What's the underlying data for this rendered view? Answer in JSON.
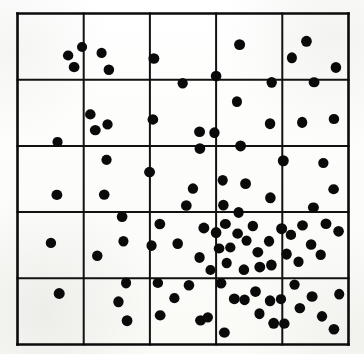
{
  "figure": {
    "title": "Clustered point pattern with 5 by 5 quadrat grid",
    "background_color": "#fdfdfb",
    "ink_color": "#0a0a0a",
    "grid_color": "#121212"
  },
  "chart_data": {
    "type": "scatter",
    "title": "Clustered point pattern with 5 by 5 quadrat grid",
    "subtitle": "",
    "xlabel": "",
    "ylabel": "",
    "xlim": [
      0,
      100
    ],
    "ylim": [
      0,
      100
    ],
    "grid": true,
    "grid_rows": 5,
    "grid_columns": 5,
    "x_gridlines": [
      0,
      20,
      40,
      60,
      80,
      100
    ],
    "y_gridlines": [
      0,
      20,
      40,
      60,
      80,
      100
    ],
    "xticklabels": [],
    "yticklabels": [],
    "legend": null,
    "legend_position": "none",
    "marker": "filled-circle",
    "marker_color": "#0a0a0a",
    "marker_radius_units": 1.6,
    "n_points": 100,
    "quadrat_counts": [
      [
        5,
        4,
        2,
        2,
        4
      ],
      [
        1,
        4,
        4,
        3,
        3
      ],
      [
        2,
        3,
        4,
        5,
        4
      ],
      [
        2,
        3,
        5,
        17,
        7
      ],
      [
        1,
        3,
        5,
        12,
        7
      ]
    ],
    "points": [
      {
        "x": 19.5,
        "y": 89.9
      },
      {
        "x": 15.3,
        "y": 87.3
      },
      {
        "x": 17.1,
        "y": 83.8
      },
      {
        "x": 25.4,
        "y": 88.1
      },
      {
        "x": 27.6,
        "y": 83.0
      },
      {
        "x": 41.2,
        "y": 86.4
      },
      {
        "x": 49.9,
        "y": 78.9
      },
      {
        "x": 60.0,
        "y": 81.1
      },
      {
        "x": 67.1,
        "y": 90.6
      },
      {
        "x": 76.8,
        "y": 79.2
      },
      {
        "x": 87.3,
        "y": 91.6
      },
      {
        "x": 82.9,
        "y": 86.6
      },
      {
        "x": 96.2,
        "y": 83.7
      },
      {
        "x": 89.6,
        "y": 79.2
      },
      {
        "x": 12.1,
        "y": 61.2
      },
      {
        "x": 22.0,
        "y": 69.5
      },
      {
        "x": 23.5,
        "y": 64.8
      },
      {
        "x": 27.2,
        "y": 66.5
      },
      {
        "x": 40.9,
        "y": 68.0
      },
      {
        "x": 55.0,
        "y": 64.3
      },
      {
        "x": 59.5,
        "y": 64.0
      },
      {
        "x": 55.1,
        "y": 59.2
      },
      {
        "x": 66.3,
        "y": 73.4
      },
      {
        "x": 76.3,
        "y": 66.7
      },
      {
        "x": 67.4,
        "y": 60.0
      },
      {
        "x": 86.0,
        "y": 67.1
      },
      {
        "x": 95.6,
        "y": 68.1
      },
      {
        "x": 11.9,
        "y": 45.2
      },
      {
        "x": 26.9,
        "y": 55.8
      },
      {
        "x": 26.2,
        "y": 45.3
      },
      {
        "x": 39.9,
        "y": 52.1
      },
      {
        "x": 53.0,
        "y": 47.1
      },
      {
        "x": 51.0,
        "y": 42.0
      },
      {
        "x": 62.0,
        "y": 49.6
      },
      {
        "x": 62.2,
        "y": 42.1
      },
      {
        "x": 68.9,
        "y": 48.6
      },
      {
        "x": 66.8,
        "y": 39.9
      },
      {
        "x": 76.4,
        "y": 44.3
      },
      {
        "x": 80.3,
        "y": 55.5
      },
      {
        "x": 92.4,
        "y": 54.8
      },
      {
        "x": 95.5,
        "y": 46.9
      },
      {
        "x": 89.4,
        "y": 41.4
      },
      {
        "x": 10.1,
        "y": 30.7
      },
      {
        "x": 31.6,
        "y": 38.6
      },
      {
        "x": 32.0,
        "y": 31.2
      },
      {
        "x": 24.1,
        "y": 26.8
      },
      {
        "x": 43.0,
        "y": 36.4
      },
      {
        "x": 40.5,
        "y": 29.9
      },
      {
        "x": 48.4,
        "y": 30.5
      },
      {
        "x": 56.3,
        "y": 35.2
      },
      {
        "x": 55.0,
        "y": 26.3
      },
      {
        "x": 60.0,
        "y": 33.8
      },
      {
        "x": 62.8,
        "y": 36.4
      },
      {
        "x": 64.3,
        "y": 29.3
      },
      {
        "x": 66.5,
        "y": 33.5
      },
      {
        "x": 69.2,
        "y": 31.4
      },
      {
        "x": 71.1,
        "y": 35.8
      },
      {
        "x": 72.6,
        "y": 27.9
      },
      {
        "x": 63.2,
        "y": 24.6
      },
      {
        "x": 68.4,
        "y": 22.6
      },
      {
        "x": 73.2,
        "y": 23.4
      },
      {
        "x": 76.0,
        "y": 31.2
      },
      {
        "x": 76.7,
        "y": 24.0
      },
      {
        "x": 79.8,
        "y": 35.0
      },
      {
        "x": 81.3,
        "y": 27.3
      },
      {
        "x": 60.9,
        "y": 29.0
      },
      {
        "x": 58.3,
        "y": 22.5
      },
      {
        "x": 82.6,
        "y": 33.1
      },
      {
        "x": 86.1,
        "y": 36.0
      },
      {
        "x": 84.9,
        "y": 25.0
      },
      {
        "x": 88.7,
        "y": 30.2
      },
      {
        "x": 93.2,
        "y": 36.5
      },
      {
        "x": 91.6,
        "y": 27.1
      },
      {
        "x": 97.0,
        "y": 34.2
      },
      {
        "x": 12.6,
        "y": 15.4
      },
      {
        "x": 30.5,
        "y": 12.9
      },
      {
        "x": 33.1,
        "y": 7.2
      },
      {
        "x": 32.8,
        "y": 18.6
      },
      {
        "x": 42.4,
        "y": 18.6
      },
      {
        "x": 43.1,
        "y": 8.8
      },
      {
        "x": 47.4,
        "y": 14.0
      },
      {
        "x": 51.8,
        "y": 17.9
      },
      {
        "x": 55.3,
        "y": 7.3
      },
      {
        "x": 57.5,
        "y": 8.2
      },
      {
        "x": 61.5,
        "y": 18.5
      },
      {
        "x": 65.5,
        "y": 13.8
      },
      {
        "x": 68.6,
        "y": 13.5
      },
      {
        "x": 71.9,
        "y": 16.0
      },
      {
        "x": 73.1,
        "y": 9.3
      },
      {
        "x": 76.3,
        "y": 13.2
      },
      {
        "x": 77.4,
        "y": 6.4
      },
      {
        "x": 79.6,
        "y": 13.7
      },
      {
        "x": 80.6,
        "y": 6.3
      },
      {
        "x": 62.5,
        "y": 3.6
      },
      {
        "x": 83.7,
        "y": 18.1
      },
      {
        "x": 85.3,
        "y": 11.0
      },
      {
        "x": 89.0,
        "y": 14.5
      },
      {
        "x": 92.0,
        "y": 8.5
      },
      {
        "x": 95.6,
        "y": 4.6
      },
      {
        "x": 97.2,
        "y": 15.2
      }
    ]
  }
}
